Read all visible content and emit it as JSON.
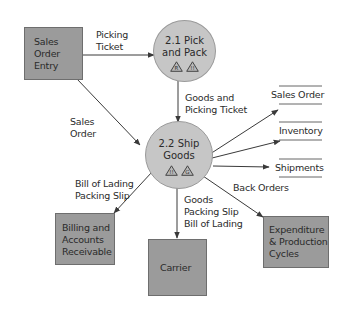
{
  "diagram": {
    "type": "data-flow-diagram",
    "colors": {
      "entity_fill": "#9b9b9b",
      "process_fill": "#c6c6c6",
      "line": "#3a3a3a",
      "background": "#ffffff"
    },
    "entities": [
      {
        "id": "sales-order-entry",
        "lines": [
          "Sales",
          "Order",
          "Entry"
        ]
      },
      {
        "id": "billing",
        "lines": [
          "Billing and",
          "Accounts",
          "Receivable"
        ]
      },
      {
        "id": "carrier",
        "lines": [
          "Carrier"
        ]
      },
      {
        "id": "expenditure",
        "lines": [
          "Expenditure",
          "& Production",
          "Cycles"
        ]
      }
    ],
    "processes": [
      {
        "id": "pick-and-pack",
        "lines": [
          "2.1 Pick",
          "and Pack"
        ],
        "icons": [
          "warning-triangle-icon",
          "warning-triangle-icon"
        ]
      },
      {
        "id": "ship-goods",
        "lines": [
          "2.2 Ship",
          "Goods"
        ],
        "icons": [
          "warning-triangle-icon",
          "warning-triangle-icon"
        ]
      }
    ],
    "data_stores": [
      {
        "id": "sales-order-store",
        "label": "Sales Order"
      },
      {
        "id": "inventory-store",
        "label": "Inventory"
      },
      {
        "id": "shipments-store",
        "label": "Shipments"
      }
    ],
    "flows": [
      {
        "from": "sales-order-entry",
        "to": "pick-and-pack",
        "lines": [
          "Picking",
          "Ticket"
        ]
      },
      {
        "from": "sales-order-entry",
        "to": "ship-goods",
        "lines": [
          "Sales",
          "Order"
        ]
      },
      {
        "from": "pick-and-pack",
        "to": "ship-goods",
        "lines": [
          "Goods and",
          "Picking Ticket"
        ]
      },
      {
        "from": "ship-goods",
        "to": "billing",
        "lines": [
          "Bill of Lading",
          "Packing Slip"
        ]
      },
      {
        "from": "ship-goods",
        "to": "carrier",
        "lines": [
          "Goods",
          "Packing Slip",
          "Bill of Lading"
        ]
      },
      {
        "from": "ship-goods",
        "to": "expenditure",
        "lines": [
          "Back Orders"
        ]
      },
      {
        "from": "ship-goods",
        "to": "sales-order-store",
        "lines": []
      },
      {
        "from": "ship-goods",
        "to": "inventory-store",
        "lines": []
      },
      {
        "from": "ship-goods",
        "to": "shipments-store",
        "lines": []
      }
    ]
  }
}
